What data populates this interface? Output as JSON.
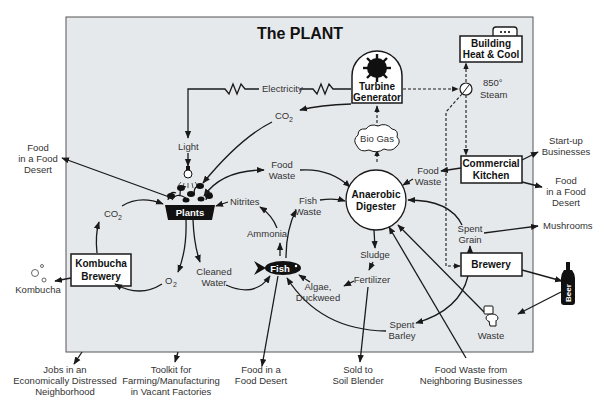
{
  "title": "The PLANT",
  "colors": {
    "panel_bg": "#e6e9ec",
    "panel_border": "#555555",
    "ink": "#1a1a1a",
    "text": "#333333"
  },
  "nodes": {
    "turbine_generator": {
      "line1": "Turbine",
      "line2": "Generator"
    },
    "building_heat_cool": {
      "line1": "Building",
      "line2": "Heat & Cool"
    },
    "steam": {
      "line1": "850°",
      "line2": "Steam"
    },
    "electricity": "Electricity",
    "co2_top": "CO",
    "co2_top_sub": "2",
    "light": "Light",
    "bio_gas": "Bio Gas",
    "commercial_kitchen": {
      "line1": "Commercial",
      "line2": "Kitchen"
    },
    "food_waste_kitchen": {
      "line1": "Food",
      "line2": "Waste"
    },
    "food_waste_plants": {
      "line1": "Food",
      "line2": "Waste"
    },
    "anaerobic_digester": {
      "line1": "Anaerobic",
      "line2": "Digester"
    },
    "nitrites": "Nitrites",
    "fish_waste": {
      "line1": "Fish",
      "line2": "Waste"
    },
    "ammonia": "Ammonia",
    "plants": "Plants",
    "co2_left": "CO",
    "co2_left_sub": "2",
    "kombucha_brewery": {
      "line1": "Kombucha",
      "line2": "Brewery"
    },
    "o2": "O",
    "o2_sub": "2",
    "cleaned_water": {
      "line1": "Cleaned",
      "line2": "Water"
    },
    "fish": "Fish",
    "sludge": "Sludge",
    "fertilizer": "Fertilizer",
    "algae_duckweed": {
      "line1": "Algae,",
      "line2": "Duckweed"
    },
    "spent_grain": {
      "line1": "Spent",
      "line2": "Grain"
    },
    "brewery": "Brewery",
    "spent_barley": {
      "line1": "Spent",
      "line2": "Barley"
    },
    "waste": "Waste",
    "beer": "Beer"
  },
  "outputs": {
    "food_desert_left": {
      "line1": "Food",
      "line2": "in a Food",
      "line3": "Desert"
    },
    "kombucha": "Kombucha",
    "startup_businesses": {
      "line1": "Start-up",
      "line2": "Businesses"
    },
    "food_desert_right": {
      "line1": "Food",
      "line2": "in a Food",
      "line3": "Desert"
    },
    "mushrooms": "Mushrooms",
    "jobs": {
      "line1": "Jobs in an",
      "line2": "Economically Distressed",
      "line3": "Neighborhood"
    },
    "toolkit": {
      "line1": "Toolkit for",
      "line2": "Farming/Manufacturing",
      "line3": "in Vacant Factories"
    },
    "food_desert_bottom": {
      "line1": "Food in a",
      "line2": "Food Desert"
    },
    "soil_blender": {
      "line1": "Sold to",
      "line2": "Soil Blender"
    },
    "food_waste_neighbors": {
      "line1": "Food Waste from",
      "line2": "Neighboring Businesses"
    }
  }
}
